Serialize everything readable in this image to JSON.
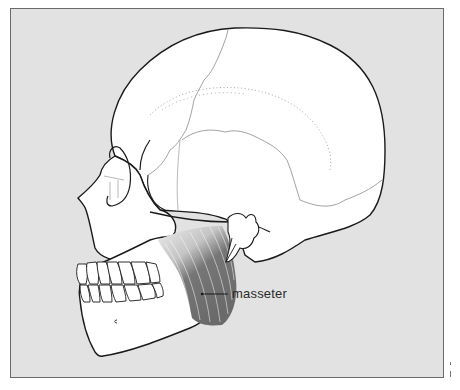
{
  "figure": {
    "colors": {
      "background_panel": "#e2e2e2",
      "frame_border": "#6a6a6a",
      "bone": "#ffffff",
      "outline": "#1a1a1a",
      "suture": "#8a8a8a",
      "muscle_dark": "#6e6e6e",
      "muscle_light": "#d4d4d4"
    },
    "labels": [
      {
        "text": "masseter",
        "target": "masseter-muscle"
      }
    ]
  }
}
